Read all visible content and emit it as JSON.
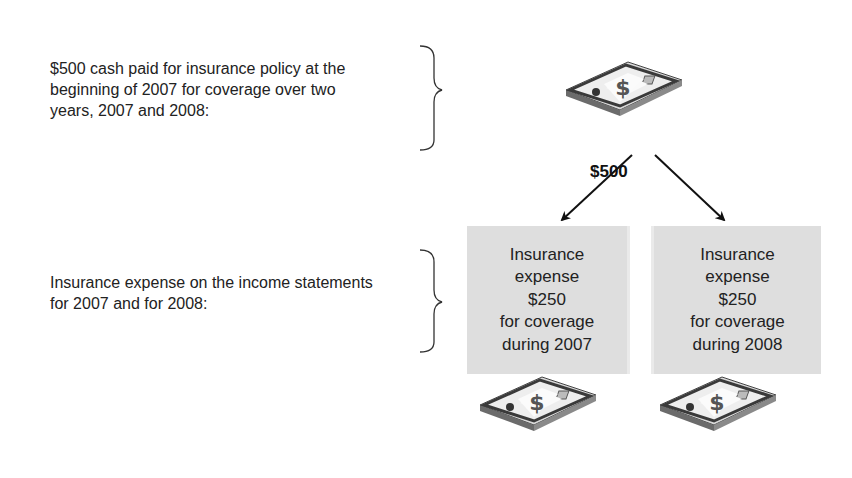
{
  "descriptions": {
    "top": "$500 cash paid for insurance policy at the beginning of 2007 for coverage over two years, 2007 and 2008:",
    "bottom": "Insurance expense on the income statements for 2007 and for 2008:"
  },
  "cash": {
    "icon": "money-stack-icon",
    "amount": "$500"
  },
  "expense_boxes": [
    {
      "line1": "Insurance",
      "line2": "expense",
      "amount": "$250",
      "line4": "for coverage",
      "line5": "during 2007"
    },
    {
      "line1": "Insurance",
      "line2": "expense",
      "amount": "$250",
      "line4": "for coverage",
      "line5": "during 2008"
    }
  ],
  "colors": {
    "box_fill": "#dedede",
    "text": "#222222",
    "arrow": "#111111"
  }
}
